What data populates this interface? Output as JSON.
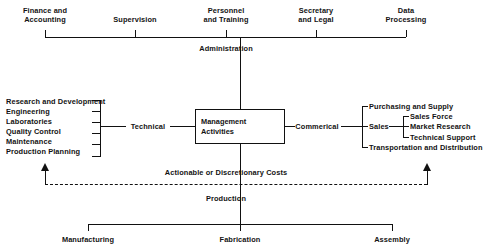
{
  "diagram": {
    "center": {
      "label": "Management\nActivities"
    },
    "administration": {
      "label": "Administration",
      "items": [
        "Finance and\nAccounting",
        "Supervision",
        "Personnel\nand Training",
        "Secretary\nand Legal",
        "Data\nProcessing"
      ]
    },
    "technical": {
      "label": "Technical",
      "items": [
        "Research and Development",
        "Engineering",
        "Laboratories",
        "Quality Control",
        "Maintenance",
        "Production Planning"
      ]
    },
    "commercial": {
      "label": "Commerical",
      "items": [
        "Purchasing and Supply",
        "Transportation and Distribution"
      ],
      "sales": {
        "label": "Sales",
        "items": [
          "Sales Force",
          "Market Research",
          "Technical Support"
        ]
      }
    },
    "costs_flow": {
      "label": "Actionable or Discretionary Costs"
    },
    "production": {
      "label": "Production",
      "items": [
        "Manufacturing",
        "Fabrication",
        "Assembly"
      ]
    }
  }
}
